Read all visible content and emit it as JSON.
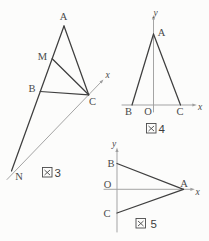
{
  "figures": {
    "fig3": {
      "caption_kanji": "図",
      "caption_number": "3",
      "vertex_labels": {
        "A": "A",
        "M": "M",
        "B": "B",
        "C": "C",
        "N": "N"
      },
      "axis_labels": {
        "x": "x"
      }
    },
    "fig4": {
      "caption_kanji": "図",
      "caption_number": "4",
      "vertex_labels": {
        "A": "A",
        "B": "B",
        "O": "O",
        "C": "C"
      },
      "axis_labels": {
        "x": "x",
        "y": "y"
      }
    },
    "fig5": {
      "caption_kanji": "図",
      "caption_number": "5",
      "vertex_labels": {
        "A": "A",
        "B": "B",
        "O": "O",
        "C": "C"
      },
      "axis_labels": {
        "x": "x",
        "y": "y"
      }
    }
  },
  "colors": {
    "line_dark": "#3f3f3f",
    "axis_gray": "#9f9f9f",
    "label_text": "#4a4a4a",
    "background": "#fcfcfb"
  }
}
